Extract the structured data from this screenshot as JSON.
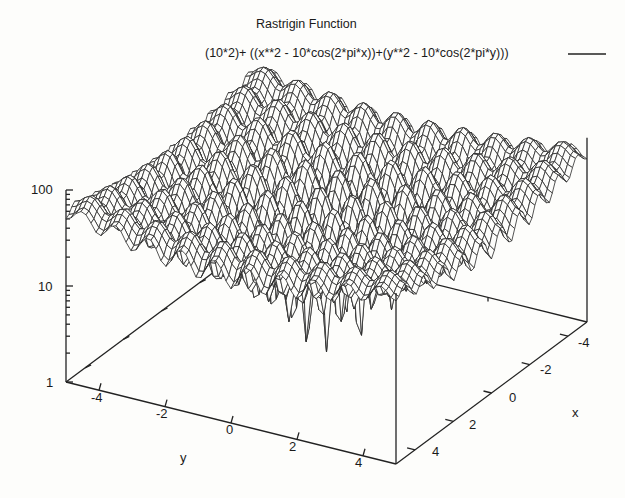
{
  "chart_data": {
    "type": "surface3d",
    "title": "Rastrigin Function",
    "legend": [
      {
        "label": "(10*2)+ ((x**2 - 10*cos(2*pi*x))+(y**2 - 10*cos(2*pi*y)))",
        "style": "solid line"
      }
    ],
    "function": "10*2 + (x^2 - 10*cos(2*pi*x)) + (y^2 - 10*cos(2*pi*y))",
    "xlabel": "x",
    "ylabel": "y",
    "zlabel": "",
    "x_range": [
      -5,
      5
    ],
    "y_range": [
      -5,
      5
    ],
    "z_range": [
      1,
      100
    ],
    "z_scale": "log",
    "x_ticks": [
      "-4",
      "-2",
      "0",
      "2",
      "4"
    ],
    "y_ticks": [
      "-4",
      "-2",
      "0",
      "2",
      "4"
    ],
    "z_ticks": [
      "1",
      "10",
      "100"
    ],
    "grid": false,
    "render": "hidden-line wireframe mesh",
    "legend_position": "top-right",
    "colors": {
      "line": "#2a2a2a",
      "background": "#fdfdfb"
    }
  },
  "labels": {
    "title": "Rastrigin Function",
    "legend_text": "(10*2)+ ((x**2 - 10*cos(2*pi*x))+(y**2 - 10*cos(2*pi*y)))",
    "x_axis": "x",
    "y_axis": "y",
    "x_ticks": [
      "-4",
      "-2",
      "0",
      "2",
      "4"
    ],
    "y_ticks": [
      "-4",
      "-2",
      "0",
      "2",
      "4"
    ],
    "z_ticks": [
      "100",
      "10",
      "1"
    ]
  }
}
